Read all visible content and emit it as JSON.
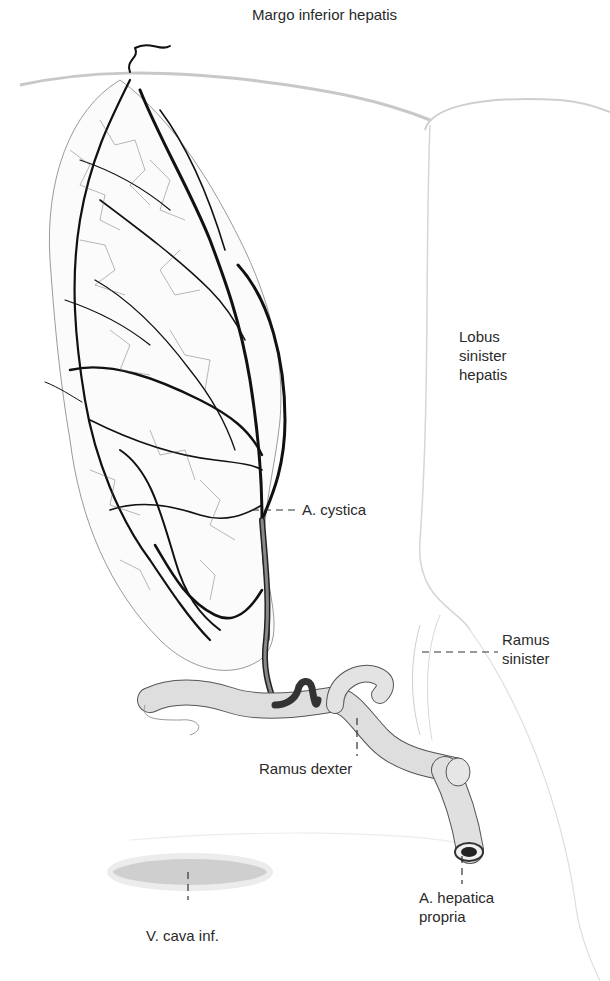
{
  "figure": {
    "colors": {
      "background": "#ffffff",
      "outline": "#bdbdbd",
      "vessel_dark": "#111111",
      "vessel_fill": "#d9d9d9",
      "label_text": "#2a2a2a"
    }
  },
  "labels": {
    "margo": "Margo inferior hepatis",
    "lobus": {
      "line1": "Lobus",
      "line2": "sinister",
      "line3": "hepatis"
    },
    "cystica": "A. cystica",
    "ramus_sinister": {
      "line1": "Ramus",
      "line2": "sinister"
    },
    "ramus_dexter": "Ramus dexter",
    "hepatica": {
      "line1": "A. hepatica",
      "line2": "propria"
    },
    "vena_cava": "V. cava inf."
  }
}
